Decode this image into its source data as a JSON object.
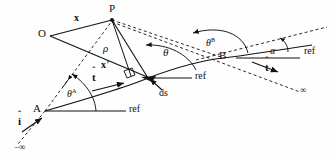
{
  "figure": {
    "background_color": "#fefefe",
    "stroke_color": "#111111",
    "labels": {
      "point_P": "P",
      "point_O": "O",
      "point_A": "A",
      "point_B": "B",
      "vector_x": "x",
      "vector_x_prime": "x",
      "vector_x_prime_mark": "'",
      "rho": "ρ",
      "theta": "θ",
      "theta_A_base": "θ",
      "theta_A_sup": "A",
      "theta_B_base": "θ",
      "theta_B_sup": "B",
      "alpha": "α",
      "ds": "ds",
      "unit_i_letter": "i",
      "unit_t_letter": "t",
      "hat_glyph": "ˆ",
      "ref_bottom_left": "ref",
      "ref_middle": "ref",
      "ref_right": "ref",
      "infinity_negative": "−∞",
      "infinity_positive": "∞"
    },
    "geometry": {
      "P": [
        112,
        19
      ],
      "O": [
        50,
        36
      ],
      "A": [
        45,
        111
      ],
      "B": [
        223,
        58
      ],
      "ds_point": [
        148,
        78
      ],
      "curve_end_left": [
        10,
        148
      ],
      "curve_end_right": [
        305,
        90
      ]
    }
  }
}
